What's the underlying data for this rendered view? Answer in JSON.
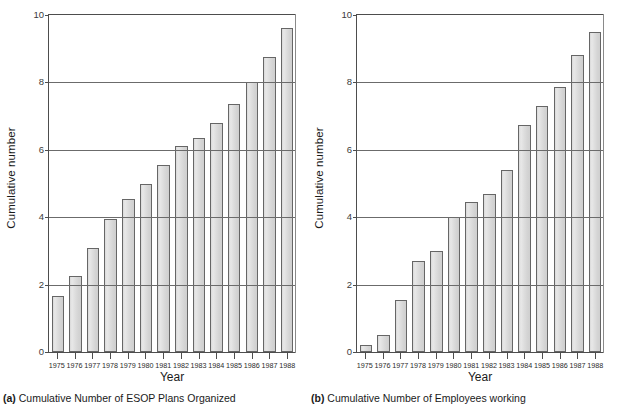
{
  "chart_data": [
    {
      "type": "bar",
      "panel": "a",
      "panel_letter": "(a)",
      "caption": "Cumulative Number of ESOP Plans Organized",
      "title": "",
      "xlabel": "Year",
      "ylabel": "Cumulative number",
      "ylim": [
        0,
        10
      ],
      "yticks": [
        0,
        2,
        4,
        6,
        8,
        10
      ],
      "grid": true,
      "legend": "none",
      "categories": [
        "1975",
        "1976",
        "1977",
        "1978",
        "1979",
        "1980",
        "1981",
        "1982",
        "1983",
        "1984",
        "1985",
        "1986",
        "1987",
        "1988"
      ],
      "values": [
        1.65,
        2.25,
        3.1,
        3.95,
        4.55,
        5.0,
        5.55,
        6.1,
        6.35,
        6.8,
        7.35,
        8.0,
        8.75,
        9.6
      ]
    },
    {
      "type": "bar",
      "panel": "b",
      "panel_letter": "(b)",
      "caption": "Cumulative Number of Employees working",
      "title": "",
      "xlabel": "Year",
      "ylabel": "Cumulative number",
      "ylim": [
        0,
        10
      ],
      "yticks": [
        0,
        2,
        4,
        6,
        8,
        10
      ],
      "grid": true,
      "legend": "none",
      "categories": [
        "1975",
        "1976",
        "1977",
        "1978",
        "1979",
        "1980",
        "1981",
        "1982",
        "1983",
        "1984",
        "1985",
        "1986",
        "1987",
        "1988"
      ],
      "values": [
        0.22,
        0.5,
        1.55,
        2.7,
        3.0,
        4.0,
        4.45,
        4.7,
        5.4,
        6.75,
        7.3,
        7.85,
        8.8,
        9.5
      ]
    }
  ],
  "colors": {
    "bar_fill": "#dedede",
    "bar_stroke": "#666666",
    "axis": "#4d4d4d",
    "grid": "#6b6b6b",
    "text": "#1a1a1a",
    "background": "#ffffff"
  }
}
